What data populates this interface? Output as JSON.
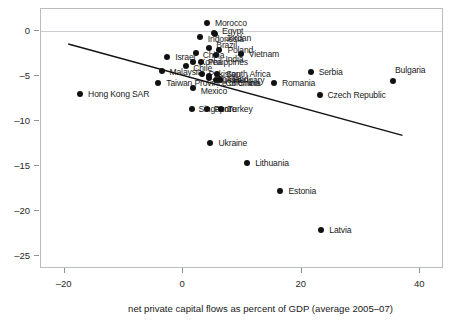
{
  "chart_data": {
    "type": "scatter",
    "title": "",
    "subtitle": "",
    "xlabel": "net private capital flows as percent of GDP (average 2005–07)",
    "ylabel": "",
    "xlim": [
      -24,
      44
    ],
    "ylim": [
      -26.5,
      2.5
    ],
    "xticks": [
      -20,
      0,
      20,
      40
    ],
    "xtick_labels": [
      "–20",
      "0",
      "20",
      "40"
    ],
    "yticks": [
      0,
      -5,
      -10,
      -15,
      -20,
      -25
    ],
    "ytick_labels": [
      "0",
      "–5",
      "–10",
      "–15",
      "–20",
      "–25"
    ],
    "grid": false,
    "legend": "none",
    "zero_reference_line": 0,
    "trendline": {
      "type": "linear",
      "x_start": -19.4,
      "y_start": -1.4,
      "x_end": 37.0,
      "y_end": -11.6
    },
    "points": [
      {
        "label": "Morocco",
        "x": 4.0,
        "y": 0.9,
        "lx": 8,
        "ly": 0,
        "anchor": "right"
      },
      {
        "label": "Egypt",
        "x": 5.2,
        "y": -0.2,
        "lx": 8,
        "ly": -2,
        "anchor": "right"
      },
      {
        "label": "Indonesia",
        "x": 2.8,
        "y": -0.6,
        "lx": 8,
        "ly": 2,
        "anchor": "right"
      },
      {
        "label": "Jordan",
        "x": 5.3,
        "y": -0.3,
        "lx": 11,
        "ly": 4,
        "anchor": "right"
      },
      {
        "label": "Brazil",
        "x": 4.4,
        "y": -1.8,
        "lx": 7,
        "ly": -3,
        "anchor": "right"
      },
      {
        "label": "Poland",
        "x": 6.1,
        "y": -2.1,
        "lx": 8,
        "ly": 0,
        "anchor": "right"
      },
      {
        "label": "Vietnam",
        "x": 9.7,
        "y": -2.5,
        "lx": 8,
        "ly": 0,
        "anchor": "right"
      },
      {
        "label": "China",
        "x": 2.1,
        "y": -2.4,
        "lx": 7,
        "ly": 2,
        "anchor": "right"
      },
      {
        "label": "India",
        "x": 5.6,
        "y": -2.6,
        "lx": 9,
        "ly": 4,
        "anchor": "right"
      },
      {
        "label": "Israel",
        "x": -2.7,
        "y": -2.8,
        "lx": 8,
        "ly": 0,
        "anchor": "right"
      },
      {
        "label": "Philippines",
        "x": 3.0,
        "y": -3.4,
        "lx": 7,
        "ly": 0,
        "anchor": "right"
      },
      {
        "label": "Korea",
        "x": 1.6,
        "y": -3.4,
        "lx": 7,
        "ly": 0,
        "anchor": "right"
      },
      {
        "label": "Chile",
        "x": 0.5,
        "y": -3.9,
        "lx": 7,
        "ly": 2,
        "anchor": "right"
      },
      {
        "label": "Malaysia",
        "x": -3.5,
        "y": -4.4,
        "lx": 7,
        "ly": 1,
        "anchor": "right"
      },
      {
        "label": "Serbia",
        "x": 21.5,
        "y": -4.5,
        "lx": 8,
        "ly": 0,
        "anchor": "right"
      },
      {
        "label": "South Africa",
        "x": 5.7,
        "y": -4.7,
        "lx": 9,
        "ly": 0,
        "anchor": "right"
      },
      {
        "label": "Pakistan",
        "x": 3.1,
        "y": -4.8,
        "lx": 7,
        "ly": 0,
        "anchor": "right"
      },
      {
        "label": "Thailand",
        "x": 4.3,
        "y": -5.0,
        "lx": 8,
        "ly": 3,
        "anchor": "right"
      },
      {
        "label": "Bulgaria",
        "x": 35.4,
        "y": -5.5,
        "lx": 2,
        "ly": -11,
        "anchor": "right"
      },
      {
        "label": "Russia",
        "x": 4.3,
        "y": -5.2,
        "lx": 8,
        "ly": 2,
        "anchor": "right"
      },
      {
        "label": "Colombia",
        "x": 5.6,
        "y": -5.4,
        "lx": 9,
        "ly": 3,
        "anchor": "right"
      },
      {
        "label": "Hungary",
        "x": 6.2,
        "y": -5.4,
        "lx": 13,
        "ly": 0,
        "anchor": "right"
      },
      {
        "label": "Taiwan Province of China",
        "x": -4.2,
        "y": -5.8,
        "lx": 8,
        "ly": 0,
        "anchor": "right"
      },
      {
        "label": "Romania",
        "x": 15.3,
        "y": -5.8,
        "lx": 8,
        "ly": 0,
        "anchor": "right"
      },
      {
        "label": "Mexico",
        "x": 1.6,
        "y": -6.3,
        "lx": 8,
        "ly": 3,
        "anchor": "right"
      },
      {
        "label": "Hong Kong SAR",
        "x": -17.4,
        "y": -7.0,
        "lx": 8,
        "ly": 0,
        "anchor": "right"
      },
      {
        "label": "Czech Republic",
        "x": 23.0,
        "y": -7.1,
        "lx": 8,
        "ly": 0,
        "anchor": "right"
      },
      {
        "label": "Singapore",
        "x": 1.4,
        "y": -8.6,
        "lx": 7,
        "ly": 0,
        "anchor": "right"
      },
      {
        "label": "Peru",
        "x": 4.0,
        "y": -8.6,
        "lx": 7,
        "ly": 0,
        "anchor": "right"
      },
      {
        "label": "Turkey",
        "x": 6.3,
        "y": -8.7,
        "lx": 7,
        "ly": 0,
        "anchor": "right"
      },
      {
        "label": "Ukraine",
        "x": 4.6,
        "y": -12.4,
        "lx": 8,
        "ly": 0,
        "anchor": "right"
      },
      {
        "label": "Lithuania",
        "x": 10.8,
        "y": -14.7,
        "lx": 8,
        "ly": 0,
        "anchor": "right"
      },
      {
        "label": "Estonia",
        "x": 16.4,
        "y": -17.8,
        "lx": 8,
        "ly": 0,
        "anchor": "right"
      },
      {
        "label": "Latvia",
        "x": 23.3,
        "y": -22.2,
        "lx": 8,
        "ly": 0,
        "anchor": "right"
      }
    ]
  },
  "colors": {
    "point": "#111111",
    "trendline": "#111111",
    "axis": "#b9bcc0",
    "zero_line": "#c9ccd0",
    "text": "#1a1a1a",
    "background": "#ffffff"
  }
}
